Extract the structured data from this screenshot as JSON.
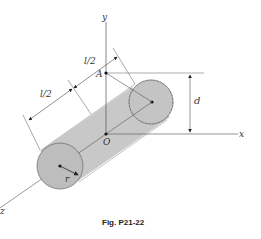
{
  "figure": {
    "caption": "Fig. P21-22",
    "labels": {
      "y_axis": "y",
      "x_axis": "x",
      "z_axis": "z",
      "point_A": "A",
      "origin": "O",
      "half_length_1": "l/2",
      "half_length_2": "l/2",
      "offset": "d",
      "radius": "r"
    },
    "colors": {
      "cylinder_fill": "#c8c8c8",
      "end_cap_fill": "#bdbdbd",
      "line": "#555555"
    }
  }
}
